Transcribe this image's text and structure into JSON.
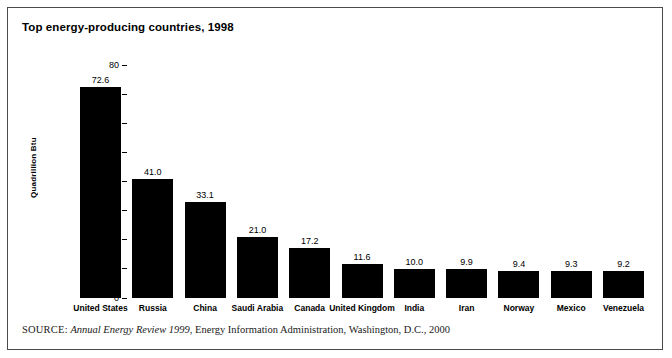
{
  "figure": {
    "title": "Top energy-producing countries, 1998",
    "source_prefix": "SOURCE:",
    "source_publication": "Annual Energy Review 1999",
    "source_rest": ", Energy Information Administration, Washington, D.C., 2000",
    "border_color": "#4a4a4a",
    "bar_color": "#000000",
    "background_color": "#ffffff"
  },
  "chart_data": {
    "type": "bar",
    "title": "Top energy-producing countries, 1998",
    "xlabel": "",
    "ylabel": "Quadrillion Btu",
    "ylim": [
      0,
      80
    ],
    "yticks": [
      "0",
      "10",
      "20",
      "30",
      "40",
      "50",
      "60",
      "70",
      "80"
    ],
    "ytick_values": [
      0,
      10,
      20,
      30,
      40,
      50,
      60,
      70,
      80
    ],
    "grid": false,
    "legend": null,
    "categories": [
      "United States",
      "Russia",
      "China",
      "Saudi Arabia",
      "Canada",
      "United Kingdom",
      "India",
      "Iran",
      "Norway",
      "Mexico",
      "Venezuela"
    ],
    "values": [
      72.6,
      41.0,
      33.1,
      21.0,
      17.2,
      11.6,
      10.0,
      9.9,
      9.4,
      9.3,
      9.2
    ],
    "value_labels": [
      "72.6",
      "41.0",
      "33.1",
      "21.0",
      "17.2",
      "11.6",
      "10.0",
      "9.9",
      "9.4",
      "9.3",
      "9.2"
    ]
  }
}
